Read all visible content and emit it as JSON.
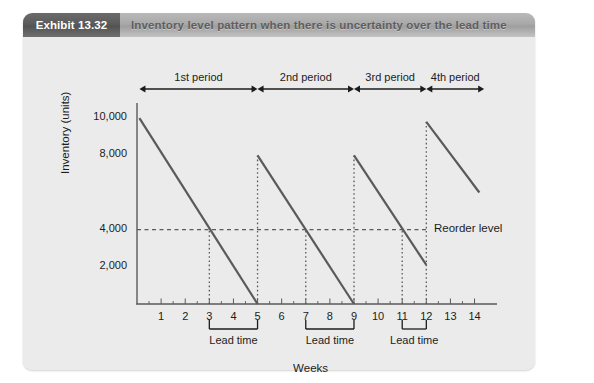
{
  "exhibit": {
    "tag": "Exhibit 13.32",
    "title": "Inventory level pattern when there is uncertainty over the lead time"
  },
  "colors": {
    "panel_bg": "#ebebeb",
    "header_bar": "#a9a9a9",
    "tag_bg": "#5b5b5b",
    "line": "#5a5a5a",
    "axis": "#5a5a5a",
    "text": "#1c1c1c",
    "title_text": "#5e5e5e"
  },
  "chart_data": {
    "type": "line",
    "title": "Inventory level pattern when there is uncertainty over the lead time",
    "xlabel": "Weeks",
    "ylabel": "Inventory (units)",
    "xlim": [
      0,
      14.6
    ],
    "ylim": [
      0,
      10600
    ],
    "grid": false,
    "legend": "none",
    "x_ticks": [
      1,
      2,
      3,
      4,
      5,
      6,
      7,
      8,
      9,
      10,
      11,
      12,
      13,
      14
    ],
    "x_tick_labels": [
      "1",
      "2",
      "3",
      "4",
      "5",
      "6",
      "7",
      "8",
      "9",
      "10",
      "11",
      "12",
      "13",
      "14"
    ],
    "y_ticks": [
      2000,
      4000,
      8000,
      10000
    ],
    "y_tick_labels": [
      "2,000",
      "4,000",
      "8,000",
      "10,000"
    ],
    "series": [
      {
        "name": "Inventory level",
        "points": [
          {
            "x": 0.1,
            "y": 10000
          },
          {
            "x": 5.0,
            "y": 0
          },
          {
            "x": 5.0,
            "y": 8000
          },
          {
            "x": 9.0,
            "y": 0
          },
          {
            "x": 9.0,
            "y": 8000
          },
          {
            "x": 12.0,
            "y": 2100
          },
          {
            "x": 12.0,
            "y": 9800
          },
          {
            "x": 14.2,
            "y": 6000
          }
        ]
      }
    ],
    "reorder_level": {
      "value": 4000,
      "label": "Reorder level",
      "style": "dashed"
    },
    "drop_lines": [
      {
        "x": 3.0,
        "from": 0,
        "to": 4000,
        "style": "dotted"
      },
      {
        "x": 5.0,
        "from": 0,
        "to": 8000,
        "style": "dotted"
      },
      {
        "x": 7.0,
        "from": 0,
        "to": 4000,
        "style": "dotted"
      },
      {
        "x": 9.0,
        "from": 0,
        "to": 8000,
        "style": "dotted"
      },
      {
        "x": 11.0,
        "from": 0,
        "to": 4000,
        "style": "dotted"
      },
      {
        "x": 12.0,
        "from": 0,
        "to": 9800,
        "style": "dotted"
      }
    ],
    "periods": [
      {
        "label": "1st period",
        "start": 0.1,
        "end": 5.0
      },
      {
        "label": "2nd  period",
        "start": 5.0,
        "end": 9.0
      },
      {
        "label": "3rd period",
        "start": 9.0,
        "end": 12.0
      },
      {
        "label": "4th period",
        "start": 12.0,
        "end": 14.4
      }
    ],
    "lead_times": [
      {
        "label": "Lead time",
        "start": 3.0,
        "end": 5.0
      },
      {
        "label": "Lead time",
        "start": 7.0,
        "end": 9.0
      },
      {
        "label": "Lead time",
        "start": 11.0,
        "end": 12.0
      }
    ]
  }
}
